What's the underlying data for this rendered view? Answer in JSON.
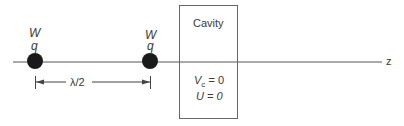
{
  "diagram": {
    "axis": {
      "label": "z"
    },
    "charges": [
      {
        "energy_label": "W",
        "charge_label": "q"
      },
      {
        "energy_label": "W",
        "charge_label": "q"
      }
    ],
    "spacing": {
      "label": "λ/2"
    },
    "cavity": {
      "title": "Cavity",
      "voltage_symbol": "V",
      "voltage_subscript": "c",
      "voltage_value": " = 0",
      "energy_line": "U = 0"
    },
    "colors": {
      "line": "#555555",
      "charge": "#1a1a1a",
      "box": "#666666"
    }
  }
}
